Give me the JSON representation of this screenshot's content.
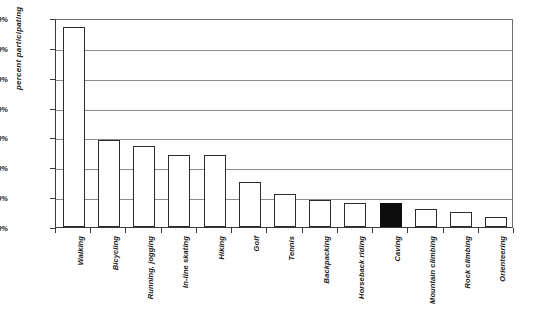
{
  "chart_data": {
    "type": "bar",
    "title": "",
    "xlabel": "",
    "ylabel": "percent participating",
    "ylim": [
      0,
      70
    ],
    "ytick_labels": [
      "0%",
      "10%",
      "20%",
      "30%",
      "40%",
      "50%",
      "60%",
      "70%"
    ],
    "ytick_values": [
      0,
      10,
      20,
      30,
      40,
      50,
      60,
      70
    ],
    "grid": true,
    "legend": "none",
    "highlight_category": "Caving",
    "highlight_color": "#0d0d0d",
    "bar_color": "#ffffff",
    "bar_border_color": "#2b2b2b",
    "gridline_color": "#8c8c8c",
    "categories": [
      "Walking",
      "Bicycling",
      "Running, jogging",
      "In-line skating",
      "Hiking",
      "Golf",
      "Tennis",
      "Backpacking",
      "Horseback riding",
      "Caving",
      "Mountain climbing",
      "Rock climbing",
      "Orienteering"
    ],
    "values": [
      67,
      29,
      27,
      24,
      24,
      15,
      11,
      9,
      8,
      8,
      6,
      5,
      3.5
    ]
  }
}
